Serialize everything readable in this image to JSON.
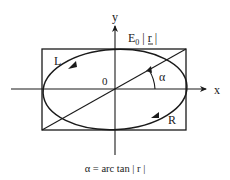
{
  "diagram": {
    "type": "polarization-ellipse",
    "axes": {
      "x_label": "x",
      "y_label": "y",
      "origin_label": "0"
    },
    "amplitude_label": {
      "base": "E",
      "subscript": "0",
      "rest": " | r |"
    },
    "rotation_labels": {
      "left": "L",
      "right": "R"
    },
    "angle_label": "α",
    "caption": "α = arc tan | r |",
    "colors": {
      "stroke": "#1a1a1a",
      "background": "#ffffff"
    }
  }
}
